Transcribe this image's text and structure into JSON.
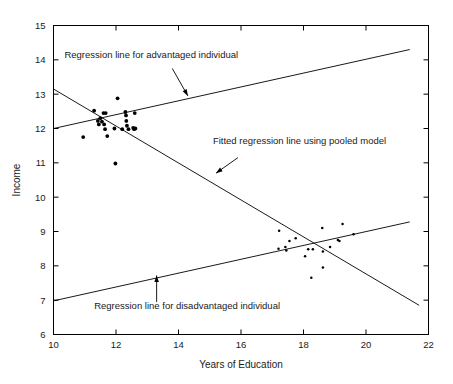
{
  "chart_data": {
    "type": "scatter",
    "title": "",
    "xlabel": "Years of Education",
    "ylabel": "Income",
    "xlim": [
      10,
      22
    ],
    "ylim": [
      6,
      15
    ],
    "xticks": [
      10,
      12,
      14,
      16,
      18,
      20,
      22
    ],
    "yticks": [
      6,
      7,
      8,
      9,
      10,
      11,
      12,
      13,
      14,
      15
    ],
    "grid": false,
    "legend": "none",
    "annotations": [
      {
        "id": "advantaged",
        "text": "Regression line for advantaged individual",
        "label_x": 10.35,
        "label_y": 14.05,
        "arrow_from": [
          13.8,
          13.75
        ],
        "arrow_to": [
          14.3,
          12.95
        ]
      },
      {
        "id": "pooled",
        "text": "Fitted regression line using pooled model",
        "label_x": 15.1,
        "label_y": 11.55,
        "arrow_from": [
          15.9,
          11.15
        ],
        "arrow_to": [
          15.2,
          10.7
        ]
      },
      {
        "id": "disadvantaged",
        "text": "Regression line for disadvantaged individual",
        "label_x": 11.3,
        "label_y": 6.75,
        "arrow_from": [
          13.3,
          6.95
        ],
        "arrow_to": [
          13.3,
          7.72
        ]
      }
    ],
    "series": [
      {
        "name": "Regression line for advantaged individual",
        "type": "line",
        "x": [
          10.0,
          21.4
        ],
        "y": [
          12.0,
          14.3
        ]
      },
      {
        "name": "Fitted regression line using pooled model",
        "type": "line",
        "x": [
          10.0,
          21.7
        ],
        "y": [
          13.15,
          6.85
        ]
      },
      {
        "name": "Regression line for disadvantaged individual",
        "type": "line",
        "x": [
          10.0,
          21.4
        ],
        "y": [
          6.98,
          9.28
        ]
      },
      {
        "name": "Advantaged group observations",
        "type": "scatter",
        "points": [
          [
            10.95,
            11.75
          ],
          [
            11.3,
            12.52
          ],
          [
            11.42,
            12.22
          ],
          [
            11.45,
            12.12
          ],
          [
            11.5,
            12.3
          ],
          [
            11.55,
            12.2
          ],
          [
            11.6,
            12.45
          ],
          [
            11.62,
            12.12
          ],
          [
            11.65,
            11.98
          ],
          [
            11.67,
            12.45
          ],
          [
            11.72,
            11.78
          ],
          [
            11.95,
            12.0
          ],
          [
            12.05,
            12.88
          ],
          [
            12.2,
            11.98
          ],
          [
            12.3,
            12.48
          ],
          [
            12.32,
            12.38
          ],
          [
            12.33,
            12.22
          ],
          [
            12.35,
            12.08
          ],
          [
            12.4,
            11.98
          ],
          [
            12.55,
            12.02
          ],
          [
            12.58,
            11.98
          ],
          [
            12.6,
            12.45
          ],
          [
            12.62,
            12.0
          ],
          [
            11.98,
            10.98
          ]
        ]
      },
      {
        "name": "Disadvantaged group observations",
        "type": "scatter",
        "points": [
          [
            17.22,
            9.02
          ],
          [
            17.2,
            8.5
          ],
          [
            17.42,
            8.55
          ],
          [
            17.45,
            8.45
          ],
          [
            17.55,
            8.72
          ],
          [
            17.75,
            8.8
          ],
          [
            18.05,
            8.28
          ],
          [
            18.15,
            8.48
          ],
          [
            18.3,
            8.48
          ],
          [
            18.25,
            7.65
          ],
          [
            18.6,
            9.1
          ],
          [
            18.62,
            8.42
          ],
          [
            18.62,
            7.95
          ],
          [
            18.85,
            8.55
          ],
          [
            19.1,
            8.75
          ],
          [
            19.15,
            8.72
          ],
          [
            19.25,
            9.22
          ],
          [
            19.6,
            8.92
          ]
        ]
      }
    ]
  }
}
